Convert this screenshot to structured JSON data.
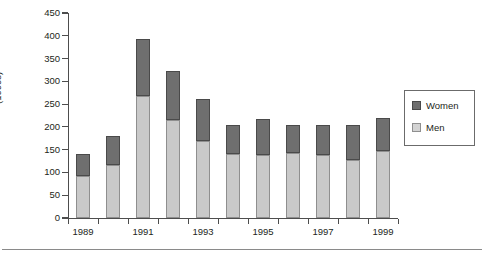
{
  "chart_data": {
    "type": "bar",
    "subtype": "stacked-vertical",
    "title": "",
    "xlabel": "",
    "ylabel": "(1000s)",
    "ylim": [
      0,
      450
    ],
    "ytick_step": 50,
    "yticks": [
      0,
      50,
      100,
      150,
      200,
      250,
      300,
      350,
      400,
      450
    ],
    "ytick_labels": [
      "0",
      "50",
      "100",
      "150",
      "200",
      "250",
      "300",
      "350",
      "400",
      "450"
    ],
    "grid": false,
    "legend_position": "right",
    "categories": [
      "1989",
      "1990",
      "1991",
      "1992",
      "1993",
      "1994",
      "1995",
      "1996",
      "1997",
      "1998",
      "1999"
    ],
    "xtick_labels": [
      "1989",
      "",
      "1991",
      "",
      "1993",
      "",
      "1995",
      "",
      "1997",
      "",
      "1999"
    ],
    "series": [
      {
        "name": "Men",
        "color": "#c9c9c9",
        "values": [
          93,
          117,
          267,
          215,
          170,
          140,
          138,
          142,
          138,
          128,
          148
        ]
      },
      {
        "name": "Women",
        "color": "#6f6f6f",
        "values": [
          48,
          64,
          125,
          107,
          91,
          64,
          80,
          63,
          66,
          77,
          72
        ]
      }
    ],
    "totals": [
      141,
      181,
      392,
      322,
      261,
      204,
      218,
      205,
      204,
      205,
      220
    ]
  },
  "legend": {
    "items": [
      {
        "label": "Women",
        "swatch": "dark-gray-swatch"
      },
      {
        "label": "Men",
        "swatch": "light-gray-swatch"
      }
    ]
  }
}
